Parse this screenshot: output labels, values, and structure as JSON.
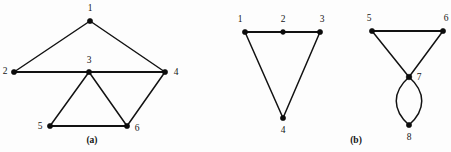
{
  "figure": {
    "background_color": "#fdfdfd",
    "stroke_color": "#121212",
    "vertex_color": "#0c0c0c",
    "label_color": "#151515",
    "width": 451,
    "height": 152,
    "panels": [
      {
        "id": "panel-a",
        "caption": "(a)",
        "caption_x": 92,
        "caption_y": 141,
        "vertices": [
          {
            "id": "a1",
            "label": "1",
            "x": 90,
            "y": 21,
            "label_x": 90,
            "label_y": 9
          },
          {
            "id": "a2",
            "label": "2",
            "x": 14,
            "y": 72,
            "label_x": 5,
            "label_y": 72
          },
          {
            "id": "a3",
            "label": "3",
            "x": 89,
            "y": 72,
            "label_x": 89,
            "label_y": 61
          },
          {
            "id": "a4",
            "label": "4",
            "x": 165,
            "y": 72,
            "label_x": 176,
            "label_y": 73
          },
          {
            "id": "a5",
            "label": "5",
            "x": 50,
            "y": 126,
            "label_x": 40,
            "label_y": 127
          },
          {
            "id": "a6",
            "label": "6",
            "x": 127,
            "y": 126,
            "label_x": 137,
            "label_y": 129
          }
        ],
        "edges": [
          {
            "id": "a-1-2",
            "from": "1",
            "to": "2",
            "x1": 90,
            "y1": 21,
            "x2": 14,
            "y2": 72,
            "weight": "normal"
          },
          {
            "id": "a-1-4",
            "from": "1",
            "to": "4",
            "x1": 90,
            "y1": 21,
            "x2": 165,
            "y2": 72,
            "weight": "normal"
          },
          {
            "id": "a-2-3",
            "from": "2",
            "to": "3",
            "x1": 14,
            "y1": 72,
            "x2": 89,
            "y2": 72,
            "weight": "thick"
          },
          {
            "id": "a-3-4",
            "from": "3",
            "to": "4",
            "x1": 89,
            "y1": 72,
            "x2": 165,
            "y2": 72,
            "weight": "thick"
          },
          {
            "id": "a-3-5",
            "from": "3",
            "to": "5",
            "x1": 89,
            "y1": 72,
            "x2": 50,
            "y2": 126,
            "weight": "normal"
          },
          {
            "id": "a-3-6",
            "from": "3",
            "to": "6",
            "x1": 89,
            "y1": 72,
            "x2": 127,
            "y2": 126,
            "weight": "normal"
          },
          {
            "id": "a-5-6",
            "from": "5",
            "to": "6",
            "x1": 50,
            "y1": 126,
            "x2": 127,
            "y2": 126,
            "weight": "thick"
          },
          {
            "id": "a-4-6",
            "from": "4",
            "to": "6",
            "x1": 165,
            "y1": 72,
            "x2": 127,
            "y2": 126,
            "weight": "normal"
          }
        ],
        "curved_edges": []
      },
      {
        "id": "panel-b-left",
        "caption": "",
        "caption_x": 0,
        "caption_y": 0,
        "vertices": [
          {
            "id": "b1",
            "label": "1",
            "x": 245,
            "y": 32,
            "label_x": 240,
            "label_y": 20
          },
          {
            "id": "b2",
            "label": "2",
            "x": 283,
            "y": 32,
            "label_x": 283,
            "label_y": 20
          },
          {
            "id": "b3",
            "label": "3",
            "x": 320,
            "y": 32,
            "label_x": 322,
            "label_y": 20
          },
          {
            "id": "b4",
            "label": "4",
            "x": 283,
            "y": 118,
            "label_x": 283,
            "label_y": 131
          }
        ],
        "edges": [
          {
            "id": "b-1-2",
            "from": "1",
            "to": "2",
            "x1": 245,
            "y1": 32,
            "x2": 283,
            "y2": 32,
            "weight": "thick"
          },
          {
            "id": "b-2-3",
            "from": "2",
            "to": "3",
            "x1": 283,
            "y1": 32,
            "x2": 320,
            "y2": 32,
            "weight": "thick"
          },
          {
            "id": "b-1-4",
            "from": "1",
            "to": "4",
            "x1": 245,
            "y1": 32,
            "x2": 283,
            "y2": 118,
            "weight": "normal"
          },
          {
            "id": "b-3-4",
            "from": "3",
            "to": "4",
            "x1": 320,
            "y1": 32,
            "x2": 283,
            "y2": 118,
            "weight": "normal"
          }
        ],
        "curved_edges": []
      },
      {
        "id": "panel-b-right",
        "caption": "(b)",
        "caption_x": 356,
        "caption_y": 141,
        "vertices": [
          {
            "id": "b5",
            "label": "5",
            "x": 372,
            "y": 31,
            "label_x": 369,
            "label_y": 19
          },
          {
            "id": "b6",
            "label": "6",
            "x": 443,
            "y": 31,
            "label_x": 446,
            "label_y": 19
          },
          {
            "id": "b7",
            "label": "7",
            "x": 409,
            "y": 77,
            "label_x": 419,
            "label_y": 78
          },
          {
            "id": "b8",
            "label": "8",
            "x": 409,
            "y": 125,
            "label_x": 409,
            "label_y": 138
          }
        ],
        "edges": [
          {
            "id": "b-5-6",
            "from": "5",
            "to": "6",
            "x1": 372,
            "y1": 31,
            "x2": 443,
            "y2": 31,
            "weight": "thick"
          },
          {
            "id": "b-5-7",
            "from": "5",
            "to": "7",
            "x1": 372,
            "y1": 31,
            "x2": 409,
            "y2": 77,
            "weight": "normal"
          },
          {
            "id": "b-6-7",
            "from": "6",
            "to": "7",
            "x1": 443,
            "y1": 31,
            "x2": 409,
            "y2": 77,
            "weight": "normal"
          }
        ],
        "curved_edges": [
          {
            "id": "b-7-8-left",
            "from": "7",
            "to": "8",
            "path": "M 409 77 C 392 92 392 110 409 125"
          },
          {
            "id": "b-7-8-right",
            "from": "7",
            "to": "8",
            "path": "M 409 77 C 426 92 426 110 409 125"
          }
        ]
      }
    ]
  }
}
